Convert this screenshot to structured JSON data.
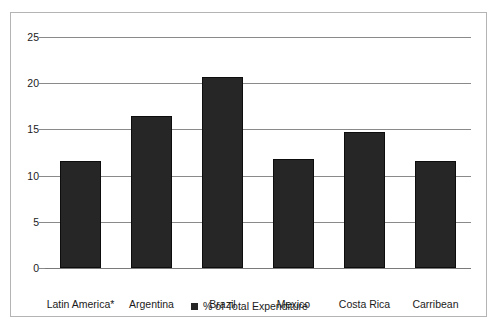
{
  "chart_data": {
    "type": "bar",
    "title": "",
    "subtitle": "",
    "xlabel": "",
    "ylabel": "",
    "categories": [
      "Latin America*",
      "Argentina",
      "Brazil",
      "Mexico",
      "Costa Rica",
      "Carribean"
    ],
    "series": [
      {
        "name": "% of Total Expenditure",
        "values": [
          11.6,
          16.4,
          20.7,
          11.8,
          14.7,
          11.6
        ],
        "color": "#262626"
      }
    ],
    "ylim": [
      0,
      25
    ],
    "ytick_labels": [
      "25",
      "20",
      "15",
      "10",
      "5",
      "0"
    ],
    "ytick_values": [
      25,
      20,
      15,
      10,
      5,
      0
    ],
    "grid": true,
    "grid_axis": "y",
    "legend_position": "bottom",
    "legend_entries": [
      {
        "label": "% of Total Expenditure",
        "marker": "square",
        "color": "#262626"
      }
    ],
    "border_color": "#b4b4b4",
    "gridline_color": "#8a8a8a",
    "background_color": "#ffffff"
  }
}
